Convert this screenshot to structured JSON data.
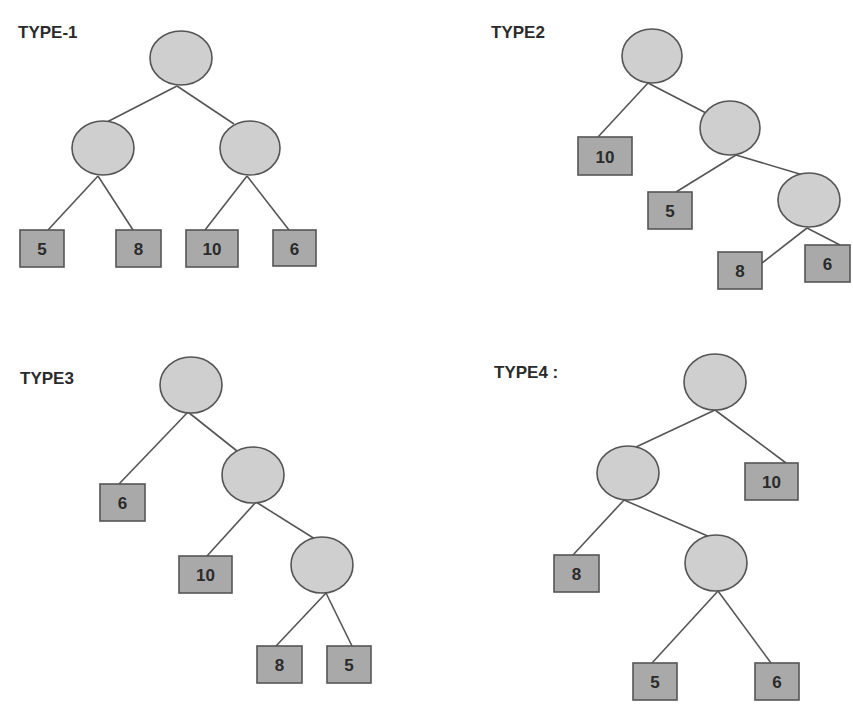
{
  "colors": {
    "background": "#ffffff",
    "internal_node_fill": "#cfcfcf",
    "leaf_fill": "#a9a9a9",
    "stroke": "#555555",
    "text": "#2b2b2b"
  },
  "trees": [
    {
      "label": "TYPE-1",
      "label_pos": [
        18,
        38
      ],
      "nodes": [
        {
          "id": "r",
          "cx": 181,
          "cy": 58,
          "rx": 31,
          "ry": 27
        },
        {
          "id": "a",
          "cx": 103,
          "cy": 148,
          "rx": 31,
          "ry": 27
        },
        {
          "id": "b",
          "cx": 250,
          "cy": 148,
          "rx": 30,
          "ry": 27
        }
      ],
      "leaves": [
        {
          "value": "5",
          "x": 20,
          "y": 230,
          "w": 44,
          "h": 37
        },
        {
          "value": "8",
          "x": 116,
          "y": 230,
          "w": 45,
          "h": 37
        },
        {
          "value": "10",
          "x": 186,
          "y": 230,
          "w": 52,
          "h": 37
        },
        {
          "value": "6",
          "x": 273,
          "y": 230,
          "w": 43,
          "h": 36
        }
      ],
      "edges": [
        [
          177,
          86,
          107,
          122
        ],
        [
          177,
          86,
          234,
          124
        ],
        [
          98,
          176,
          48,
          230
        ],
        [
          98,
          176,
          133,
          230
        ],
        [
          247,
          176,
          205,
          230
        ],
        [
          247,
          176,
          289,
          230
        ]
      ]
    },
    {
      "label": "TYPE2",
      "label_pos": [
        491,
        38
      ],
      "nodes": [
        {
          "id": "r",
          "cx": 652,
          "cy": 56,
          "rx": 30,
          "ry": 27
        },
        {
          "id": "a",
          "cx": 730,
          "cy": 128,
          "rx": 30,
          "ry": 27
        },
        {
          "id": "b",
          "cx": 809,
          "cy": 200,
          "rx": 31,
          "ry": 27
        }
      ],
      "leaves": [
        {
          "value": "10",
          "x": 578,
          "y": 137,
          "w": 54,
          "h": 38
        },
        {
          "value": "5",
          "x": 648,
          "y": 192,
          "w": 44,
          "h": 37
        },
        {
          "value": "8",
          "x": 718,
          "y": 252,
          "w": 44,
          "h": 37
        },
        {
          "value": "6",
          "x": 805,
          "y": 245,
          "w": 45,
          "h": 37
        }
      ],
      "edges": [
        [
          648,
          83,
          598,
          137
        ],
        [
          648,
          83,
          706,
          113
        ],
        [
          736,
          155,
          676,
          192
        ],
        [
          736,
          155,
          803,
          175
        ],
        [
          807,
          228,
          762,
          263
        ],
        [
          807,
          228,
          840,
          245
        ]
      ]
    },
    {
      "label": "TYPE3",
      "label_pos": [
        20,
        384
      ],
      "nodes": [
        {
          "id": "r",
          "cx": 191,
          "cy": 385,
          "rx": 31,
          "ry": 28
        },
        {
          "id": "a",
          "cx": 253,
          "cy": 475,
          "rx": 31,
          "ry": 28
        },
        {
          "id": "b",
          "cx": 322,
          "cy": 565,
          "rx": 31,
          "ry": 28
        }
      ],
      "leaves": [
        {
          "value": "6",
          "x": 100,
          "y": 484,
          "w": 45,
          "h": 37
        },
        {
          "value": "10",
          "x": 179,
          "y": 556,
          "w": 53,
          "h": 37
        },
        {
          "value": "8",
          "x": 257,
          "y": 646,
          "w": 45,
          "h": 37
        },
        {
          "value": "5",
          "x": 327,
          "y": 646,
          "w": 44,
          "h": 37
        }
      ],
      "edges": [
        [
          188,
          412,
          119,
          484
        ],
        [
          188,
          412,
          237,
          451
        ],
        [
          256,
          502,
          207,
          556
        ],
        [
          256,
          502,
          315,
          539
        ],
        [
          326,
          593,
          276,
          646
        ],
        [
          326,
          593,
          352,
          646
        ]
      ]
    },
    {
      "label": "TYPE4 :",
      "label_pos": [
        494,
        378
      ],
      "nodes": [
        {
          "id": "r",
          "cx": 715,
          "cy": 382,
          "rx": 31,
          "ry": 28
        },
        {
          "id": "a",
          "cx": 628,
          "cy": 473,
          "rx": 31,
          "ry": 27
        },
        {
          "id": "b",
          "cx": 716,
          "cy": 563,
          "rx": 31,
          "ry": 28
        }
      ],
      "leaves": [
        {
          "value": "10",
          "x": 745,
          "y": 463,
          "w": 53,
          "h": 37
        },
        {
          "value": "8",
          "x": 554,
          "y": 555,
          "w": 45,
          "h": 37
        },
        {
          "value": "5",
          "x": 633,
          "y": 663,
          "w": 44,
          "h": 37
        },
        {
          "value": "6",
          "x": 755,
          "y": 663,
          "w": 44,
          "h": 37
        }
      ],
      "edges": [
        [
          715,
          410,
          636,
          447
        ],
        [
          715,
          410,
          786,
          463
        ],
        [
          624,
          500,
          573,
          555
        ],
        [
          624,
          500,
          710,
          537
        ],
        [
          718,
          591,
          652,
          663
        ],
        [
          718,
          591,
          771,
          663
        ]
      ]
    }
  ]
}
